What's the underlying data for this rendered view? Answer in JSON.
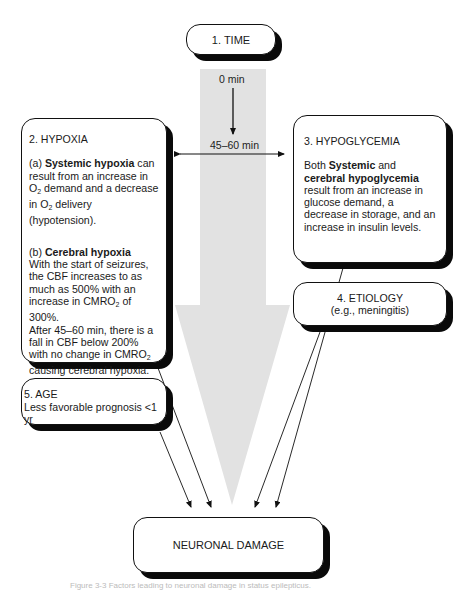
{
  "diagram": {
    "colors": {
      "arrow_fill": "#e2e2e2",
      "stroke": "#111111",
      "shadow": "#0a0a0a",
      "background": "#ffffff"
    },
    "timeline": {
      "start_label": "0 min",
      "end_label": "45–60 min"
    },
    "boxes": {
      "time": {
        "label": "1. TIME"
      },
      "hypoxia": {
        "title": "2. HYPOXIA",
        "a_prefix": "(a) ",
        "a_bold": "Systemic hypoxia",
        "a_text_1": " can result from an increase in O",
        "a_sub_1": "2",
        "a_text_2": " demand and a decrease in O",
        "a_sub_2": "2",
        "a_text_3": " delivery (hypotension).",
        "b_prefix": "(b) ",
        "b_bold": "Cerebral hypoxia",
        "b_text_1": "With the start of seizures, the CBF increases to as much as 500% with an increase in CMRO",
        "b_sub_1": "2",
        "b_text_2": " of 300%.",
        "b_text_3": "After 45–60 min, there is a fall in CBF below 200% with no change in CMRO",
        "b_sub_2": "2",
        "b_text_4": " causing cerebral hypoxia."
      },
      "hypoglycemia": {
        "title": "3. HYPOGLYCEMIA",
        "text_1": "Both ",
        "bold_1": "Systemic",
        "text_2": " and ",
        "bold_2": "cerebral hypoglycemia",
        "text_3": " result from an increase in glucose demand, a decrease in storage, and an increase in insulin levels."
      },
      "etiology": {
        "title": "4. ETIOLOGY",
        "subtitle": "(e.g., meningitis)"
      },
      "age": {
        "title": "5. AGE",
        "text": "Less favorable prognosis <1 yr"
      },
      "outcome": {
        "label": "NEURONAL DAMAGE"
      }
    },
    "caption": "Figure 3-3  Factors leading to neuronal damage in status epilepticus."
  }
}
